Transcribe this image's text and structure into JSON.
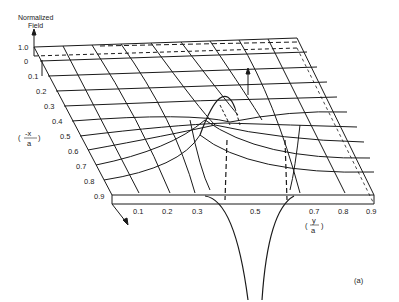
{
  "figure": {
    "z_axis_label_line1": "Normalized",
    "z_axis_label_line2": "Field",
    "z_ticks": [
      "1.0",
      "0"
    ],
    "x_axis_label": "(-x/a)",
    "x_axis_num": "-x",
    "x_axis_den": "a",
    "x_ticks": [
      "0.1",
      "0.2",
      "0.3",
      "0.4",
      "0.5",
      "0.6",
      "0.7",
      "0.8",
      "0.9"
    ],
    "y_axis_label": "(y/a)",
    "y_axis_num": "y",
    "y_axis_den": "a",
    "y_ticks": [
      "0.1",
      "0.2",
      "0.3",
      "0.5",
      "0.7",
      "0.8",
      "0.9"
    ],
    "panel_label": "(a)",
    "line_color": "#1a1a1a",
    "background": "#ffffff"
  }
}
